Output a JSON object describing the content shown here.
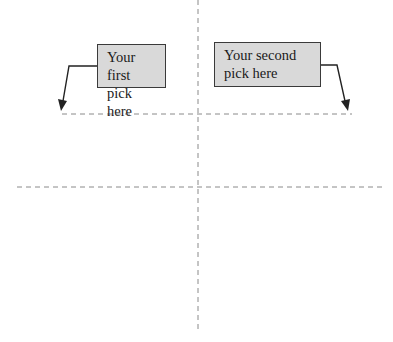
{
  "diagram": {
    "callouts": [
      {
        "id": "first",
        "lines": [
          "Your first",
          "pick here"
        ]
      },
      {
        "id": "second",
        "lines": [
          "Your second",
          "pick here"
        ]
      }
    ],
    "guides": {
      "vertical_axis": "dashed",
      "horizontal_axis": "dashed",
      "top_pick_line": "dashed"
    },
    "colors": {
      "callout_fill": "#d9d9d9",
      "callout_border": "#3a3a3a",
      "dash_line": "#8a8a8a",
      "arrow": "#222222"
    }
  }
}
